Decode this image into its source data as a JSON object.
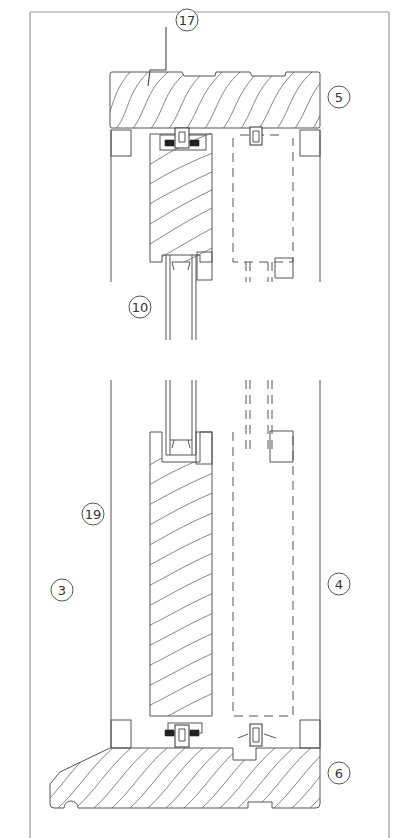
{
  "drawing": {
    "type": "technical section drawing",
    "subject": "sliding sash window vertical section",
    "colors": {
      "line": "#555555",
      "frame": "#999999",
      "background": "#ffffff"
    }
  },
  "labels": [
    {
      "id": "17",
      "text": "17",
      "x": 187,
      "y": 20
    },
    {
      "id": "5",
      "text": "5",
      "x": 339,
      "y": 97
    },
    {
      "id": "10",
      "text": "10",
      "x": 140,
      "y": 307
    },
    {
      "id": "19",
      "text": "19",
      "x": 93,
      "y": 514
    },
    {
      "id": "3",
      "text": "3",
      "x": 62,
      "y": 590
    },
    {
      "id": "4",
      "text": "4",
      "x": 339,
      "y": 584
    },
    {
      "id": "6",
      "text": "6",
      "x": 339,
      "y": 773
    }
  ],
  "parts": {
    "head": "5",
    "sill": "6",
    "interior_side": "3",
    "exterior_side": "4",
    "glazing": "10",
    "jamb": "19",
    "flashing": "17"
  }
}
